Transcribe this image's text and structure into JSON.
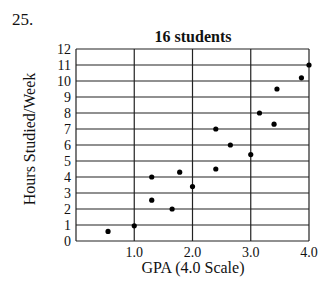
{
  "question_number": "25.",
  "chart_data": {
    "type": "scatter",
    "title": "16 students",
    "xlabel": "GPA (4.0 Scale)",
    "ylabel": "Hours Studied/Week",
    "xlim": [
      0,
      4
    ],
    "ylim": [
      0,
      12
    ],
    "x_ticks": [
      "1.0",
      "2.0",
      "3.0",
      "4.0"
    ],
    "y_ticks": [
      "0",
      "1",
      "2",
      "3",
      "4",
      "5",
      "6",
      "7",
      "8",
      "9",
      "10",
      "11",
      "12"
    ],
    "grid": true,
    "points": [
      {
        "x": 0.55,
        "y": 0.6
      },
      {
        "x": 1.0,
        "y": 0.95
      },
      {
        "x": 1.3,
        "y": 4.0
      },
      {
        "x": 1.3,
        "y": 2.55
      },
      {
        "x": 1.65,
        "y": 2.0
      },
      {
        "x": 1.78,
        "y": 4.3
      },
      {
        "x": 2.0,
        "y": 3.4
      },
      {
        "x": 2.4,
        "y": 4.5
      },
      {
        "x": 2.4,
        "y": 7.0
      },
      {
        "x": 2.65,
        "y": 6.0
      },
      {
        "x": 3.0,
        "y": 5.4
      },
      {
        "x": 3.15,
        "y": 8.0
      },
      {
        "x": 3.4,
        "y": 7.3
      },
      {
        "x": 3.45,
        "y": 9.5
      },
      {
        "x": 3.87,
        "y": 10.2
      },
      {
        "x": 4.0,
        "y": 11.0
      }
    ]
  }
}
